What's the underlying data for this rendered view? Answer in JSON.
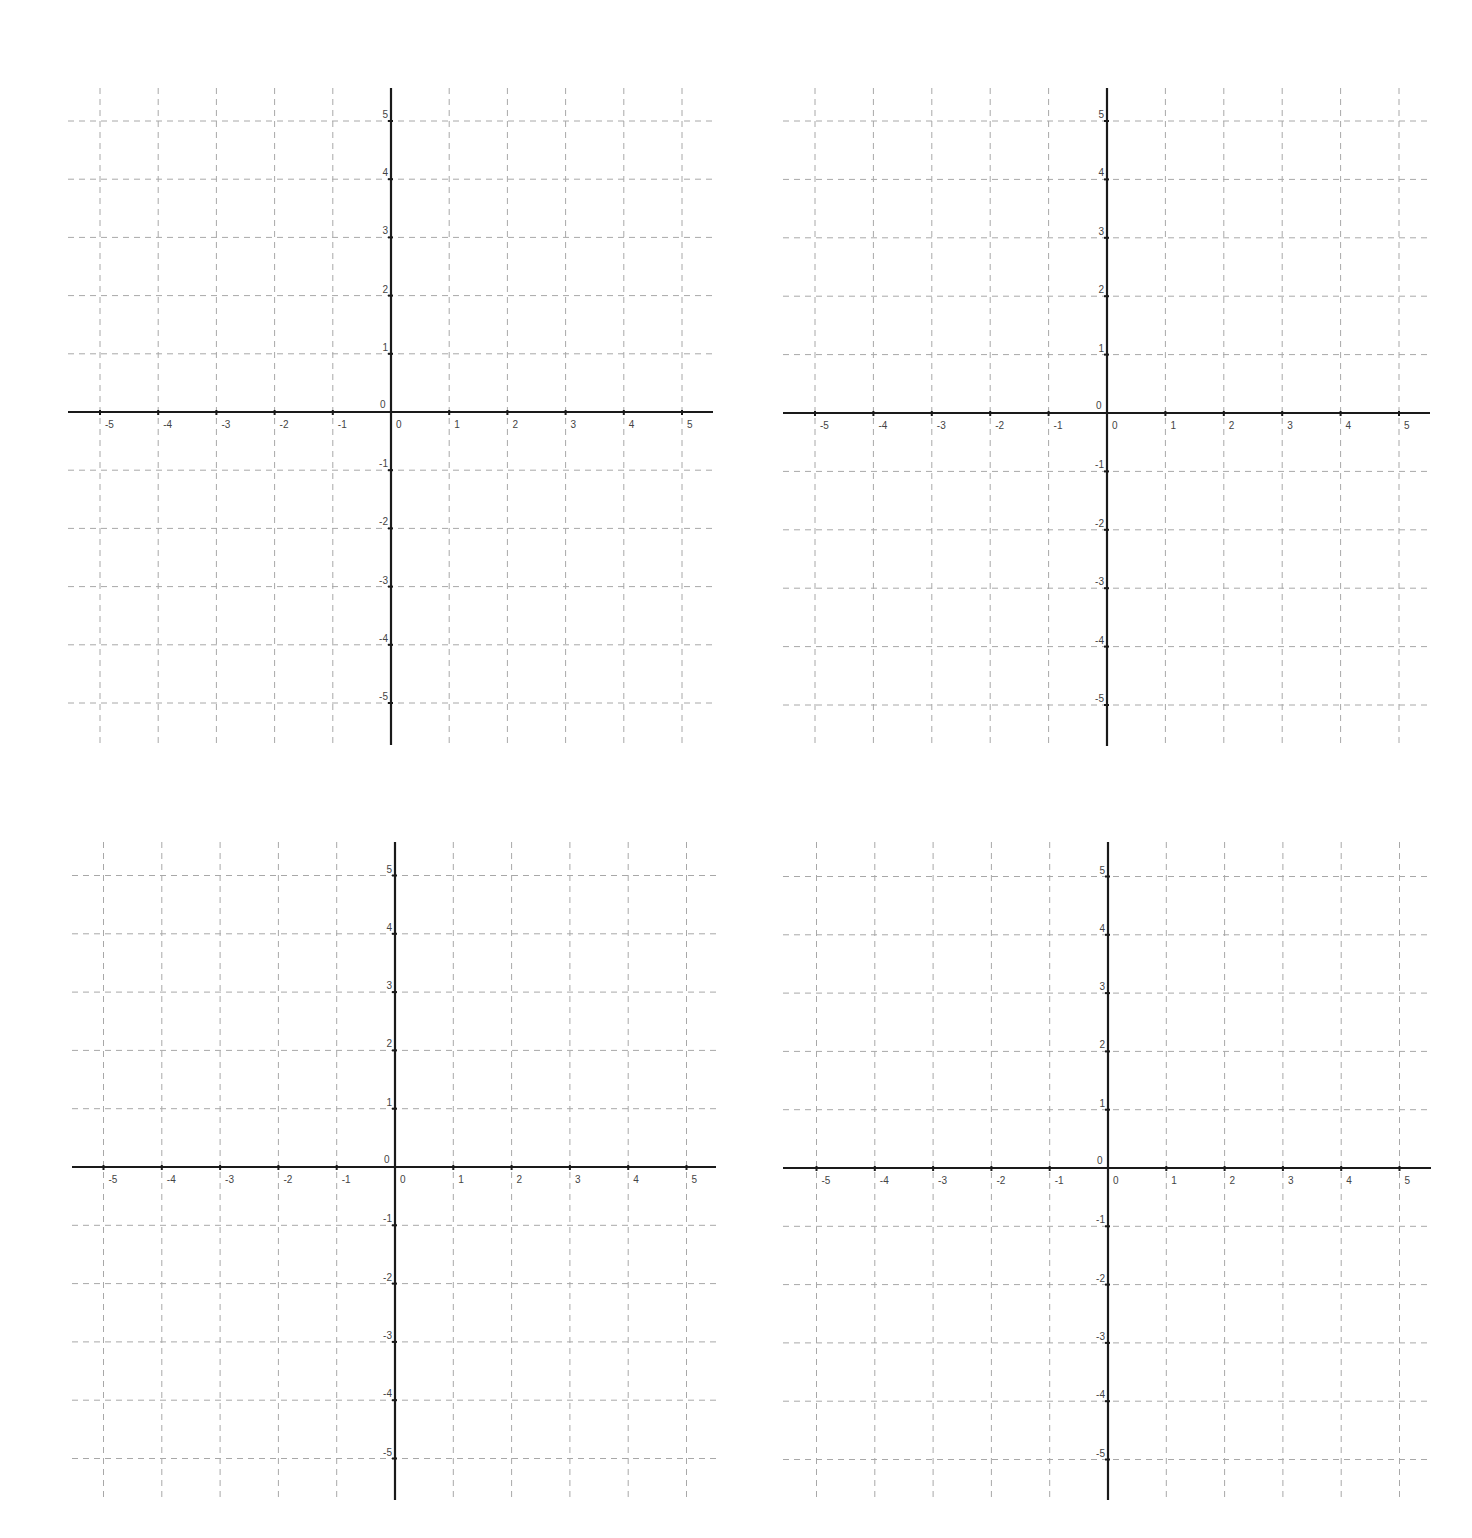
{
  "colors": {
    "axis": "#1a1a1a",
    "grid": "#a8a8a8",
    "label": "#444444",
    "background": "#ffffff"
  },
  "chart_data": [
    {
      "type": "scatter",
      "title": "",
      "xlabel": "",
      "ylabel": "",
      "xlim": [
        -5.5,
        5.5
      ],
      "ylim": [
        -5.5,
        5.5
      ],
      "x_ticks": [
        "-5",
        "-4",
        "-3",
        "-2",
        "-1",
        "0",
        "1",
        "2",
        "3",
        "4",
        "5"
      ],
      "y_ticks": [
        "5",
        "4",
        "3",
        "2",
        "1",
        "0",
        "-1",
        "-2",
        "-3",
        "-4",
        "-5"
      ],
      "grid": true,
      "grid_style": "dashed",
      "series": [],
      "placement": {
        "origin_x": 391,
        "origin_y": 412,
        "unit": 58.2,
        "left": 68,
        "right": 713,
        "top": 88,
        "bottom": 745
      }
    },
    {
      "type": "scatter",
      "title": "",
      "xlabel": "",
      "ylabel": "",
      "xlim": [
        -5.5,
        5.5
      ],
      "ylim": [
        -5.5,
        5.5
      ],
      "x_ticks": [
        "-5",
        "-4",
        "-3",
        "-2",
        "-1",
        "0",
        "1",
        "2",
        "3",
        "4",
        "5"
      ],
      "y_ticks": [
        "5",
        "4",
        "3",
        "2",
        "1",
        "0",
        "-1",
        "-2",
        "-3",
        "-4",
        "-5"
      ],
      "grid": true,
      "grid_style": "dashed",
      "series": [],
      "placement": {
        "origin_x": 1107,
        "origin_y": 413,
        "unit": 58.4,
        "left": 783,
        "right": 1430,
        "top": 88,
        "bottom": 746
      }
    },
    {
      "type": "scatter",
      "title": "",
      "xlabel": "",
      "ylabel": "",
      "xlim": [
        -5.5,
        5.5
      ],
      "ylim": [
        -5.5,
        5.5
      ],
      "x_ticks": [
        "-5",
        "-4",
        "-3",
        "-2",
        "-1",
        "0",
        "1",
        "2",
        "3",
        "4",
        "5"
      ],
      "y_ticks": [
        "5",
        "4",
        "3",
        "2",
        "1",
        "0",
        "-1",
        "-2",
        "-3",
        "-4",
        "-5"
      ],
      "grid": true,
      "grid_style": "dashed",
      "series": [],
      "placement": {
        "origin_x": 395,
        "origin_y": 1167,
        "unit": 58.3,
        "left": 72,
        "right": 716,
        "top": 842,
        "bottom": 1500
      }
    },
    {
      "type": "scatter",
      "title": "",
      "xlabel": "",
      "ylabel": "",
      "xlim": [
        -5.5,
        5.5
      ],
      "ylim": [
        -5.5,
        5.5
      ],
      "x_ticks": [
        "-5",
        "-4",
        "-3",
        "-2",
        "-1",
        "0",
        "1",
        "2",
        "3",
        "4",
        "5"
      ],
      "y_ticks": [
        "5",
        "4",
        "3",
        "2",
        "1",
        "0",
        "-1",
        "-2",
        "-3",
        "-4",
        "-5"
      ],
      "grid": true,
      "grid_style": "dashed",
      "series": [],
      "placement": {
        "origin_x": 1108,
        "origin_y": 1168,
        "unit": 58.3,
        "left": 783,
        "right": 1431,
        "top": 842,
        "bottom": 1500
      }
    }
  ]
}
